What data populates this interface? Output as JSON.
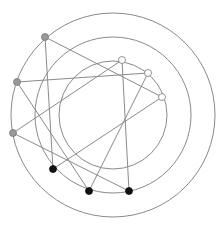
{
  "diagram": {
    "type": "radial-layered-graph",
    "center": [
      113,
      115
    ],
    "circles": [
      {
        "name": "outer",
        "r": 102
      },
      {
        "name": "middle",
        "r": 78
      },
      {
        "name": "inner",
        "r": 54
      }
    ],
    "colors": {
      "circle": "#8a8a8a",
      "edge": "#8a8a8a",
      "gray_node": "#999999",
      "black_node": "#111111",
      "white_node": "#ffffff",
      "node_stroke": "#777777"
    },
    "nodes": [
      {
        "id": "g1",
        "group": "gray",
        "x": 45,
        "y": 37
      },
      {
        "id": "g2",
        "group": "gray",
        "x": 17,
        "y": 82
      },
      {
        "id": "g3",
        "group": "gray",
        "x": 13,
        "y": 133
      },
      {
        "id": "w1",
        "group": "white",
        "x": 122,
        "y": 60
      },
      {
        "id": "w2",
        "group": "white",
        "x": 148,
        "y": 73
      },
      {
        "id": "w3",
        "group": "white",
        "x": 162,
        "y": 97
      },
      {
        "id": "b1",
        "group": "black",
        "x": 53,
        "y": 169
      },
      {
        "id": "b2",
        "group": "black",
        "x": 89,
        "y": 191
      },
      {
        "id": "b3",
        "group": "black",
        "x": 129,
        "y": 191
      }
    ],
    "edges": [
      [
        "g1",
        "b1"
      ],
      [
        "g1",
        "w3"
      ],
      [
        "g2",
        "w2"
      ],
      [
        "g2",
        "b2"
      ],
      [
        "g3",
        "w1"
      ],
      [
        "g3",
        "b3"
      ],
      [
        "w1",
        "b3"
      ],
      [
        "w2",
        "b2"
      ],
      [
        "w3",
        "b1"
      ]
    ]
  }
}
